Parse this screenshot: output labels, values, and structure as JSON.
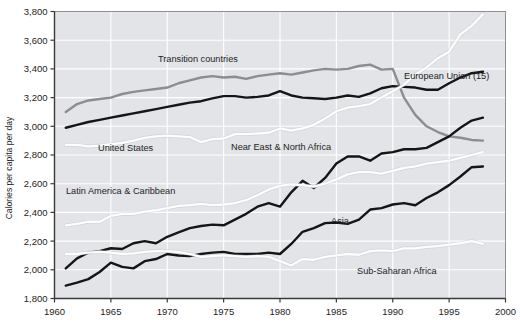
{
  "chart_data": {
    "type": "line",
    "title": "",
    "subtitle": "",
    "xlabel": "",
    "ylabel": "Calories per capita per day",
    "xlim": [
      1960,
      2000
    ],
    "ylim": [
      1800,
      3800
    ],
    "xticks": [
      1960,
      1965,
      1970,
      1975,
      1980,
      1985,
      1990,
      1995,
      2000
    ],
    "xtick_labels": [
      "1960",
      "1965",
      "1970",
      "1975",
      "1980",
      "1985",
      "1990",
      "1995",
      "2000"
    ],
    "yticks": [
      1800,
      2000,
      2200,
      2400,
      2600,
      2800,
      3000,
      3200,
      3400,
      3600,
      3800
    ],
    "ytick_labels": [
      "1,800",
      "2,000",
      "2,200",
      "2,400",
      "2,600",
      "2,800",
      "3,000",
      "3,200",
      "3,400",
      "3,600",
      "3,800"
    ],
    "grid": true,
    "grid_color": "#ffffff",
    "plot_background": "#e2e4e8",
    "legend_position": "inline-annotations",
    "x": [
      1961,
      1962,
      1963,
      1964,
      1965,
      1966,
      1967,
      1968,
      1969,
      1970,
      1971,
      1972,
      1973,
      1974,
      1975,
      1976,
      1977,
      1978,
      1979,
      1980,
      1981,
      1982,
      1983,
      1984,
      1985,
      1986,
      1987,
      1988,
      1989,
      1990,
      1991,
      1992,
      1993,
      1994,
      1995,
      1996,
      1997,
      1998
    ],
    "series": [
      {
        "name": "Transition countries",
        "color": "#8b8d91",
        "values": [
          3100,
          3155,
          3180,
          3190,
          3200,
          3225,
          3240,
          3250,
          3260,
          3270,
          3300,
          3320,
          3340,
          3350,
          3340,
          3345,
          3330,
          3350,
          3360,
          3370,
          3360,
          3375,
          3390,
          3400,
          3395,
          3400,
          3420,
          3430,
          3395,
          3400,
          3200,
          3080,
          3000,
          2960,
          2930,
          2920,
          2905,
          2900
        ]
      },
      {
        "name": "European Union (15)",
        "color": "#151515",
        "values": [
          2990,
          3010,
          3030,
          3045,
          3060,
          3075,
          3090,
          3105,
          3120,
          3135,
          3150,
          3165,
          3175,
          3195,
          3210,
          3210,
          3200,
          3205,
          3215,
          3245,
          3215,
          3200,
          3195,
          3190,
          3200,
          3215,
          3205,
          3230,
          3265,
          3280,
          3275,
          3270,
          3255,
          3255,
          3300,
          3340,
          3370,
          3380
        ]
      },
      {
        "name": "United States",
        "color": "#fdfdfd",
        "values": [
          2870,
          2870,
          2860,
          2865,
          2875,
          2885,
          2900,
          2920,
          2930,
          2935,
          2930,
          2925,
          2890,
          2910,
          2915,
          2945,
          2945,
          2950,
          2955,
          2985,
          2970,
          2985,
          3010,
          3055,
          3105,
          3130,
          3140,
          3155,
          3200,
          3245,
          3290,
          3360,
          3410,
          3475,
          3520,
          3640,
          3700,
          3780
        ]
      },
      {
        "name": "Near East & North Africa",
        "color": "#151515",
        "values": [
          2010,
          2080,
          2120,
          2130,
          2150,
          2145,
          2185,
          2200,
          2185,
          2230,
          2260,
          2290,
          2305,
          2315,
          2310,
          2350,
          2390,
          2440,
          2465,
          2440,
          2540,
          2620,
          2570,
          2640,
          2740,
          2790,
          2790,
          2760,
          2810,
          2820,
          2840,
          2840,
          2850,
          2890,
          2930,
          2990,
          3040,
          3060
        ]
      },
      {
        "name": "Latin America & Caribbean",
        "color": "#fdfdfd",
        "values": [
          2310,
          2320,
          2335,
          2335,
          2375,
          2390,
          2390,
          2405,
          2415,
          2430,
          2445,
          2450,
          2460,
          2450,
          2455,
          2465,
          2485,
          2520,
          2560,
          2585,
          2595,
          2590,
          2580,
          2600,
          2630,
          2665,
          2680,
          2680,
          2670,
          2690,
          2710,
          2720,
          2740,
          2750,
          2760,
          2780,
          2800,
          2820
        ]
      },
      {
        "name": "Asia",
        "color": "#151515",
        "values": [
          1890,
          1910,
          1935,
          1985,
          2050,
          2020,
          2010,
          2060,
          2075,
          2110,
          2100,
          2095,
          2110,
          2120,
          2125,
          2110,
          2110,
          2110,
          2120,
          2110,
          2180,
          2265,
          2290,
          2325,
          2330,
          2320,
          2350,
          2420,
          2430,
          2455,
          2465,
          2450,
          2500,
          2540,
          2590,
          2650,
          2715,
          2720
        ]
      },
      {
        "name": "Sub-Saharan Africa",
        "color": "#fdfdfd",
        "values": [
          2110,
          2110,
          2120,
          2125,
          2120,
          2110,
          2115,
          2125,
          2130,
          2130,
          2125,
          2110,
          2090,
          2095,
          2100,
          2095,
          2090,
          2095,
          2090,
          2060,
          2030,
          2075,
          2070,
          2090,
          2100,
          2110,
          2105,
          2130,
          2135,
          2130,
          2150,
          2150,
          2160,
          2165,
          2175,
          2185,
          2200,
          2180
        ]
      }
    ],
    "annotations": [
      {
        "text": "Transition countries",
        "x_px": 158,
        "y_px": 62,
        "anchor": "start"
      },
      {
        "text": "European Union (15)",
        "x_px": 404,
        "y_px": 79,
        "anchor": "start"
      },
      {
        "text": "United States",
        "x_px": 98,
        "y_px": 151,
        "anchor": "start"
      },
      {
        "text": "Near East & North Africa",
        "x_px": 231,
        "y_px": 150,
        "anchor": "start"
      },
      {
        "text": "Latin America & Caribbean",
        "x_px": 66,
        "y_px": 194,
        "anchor": "start"
      },
      {
        "text": "Asia",
        "x_px": 331,
        "y_px": 224,
        "anchor": "start"
      },
      {
        "text": "Sub-Saharan Africa",
        "x_px": 357,
        "y_px": 274,
        "anchor": "start"
      }
    ]
  }
}
